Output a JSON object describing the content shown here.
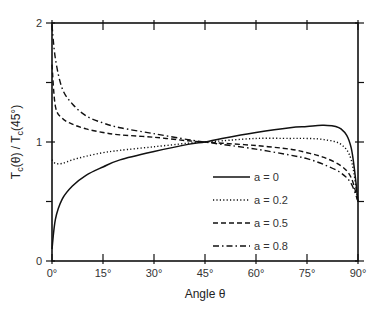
{
  "chart_data": {
    "type": "line",
    "title": "",
    "xlabel": "Angle θ",
    "ylabel": "T_c(θ) / T_c(45°)",
    "xlim": [
      0,
      90
    ],
    "ylim": [
      0,
      2
    ],
    "grid": false,
    "x_ticks": [
      "0°",
      "15°",
      "30°",
      "45°",
      "60°",
      "75°",
      "90°"
    ],
    "x_tick_values": [
      0,
      15,
      30,
      45,
      60,
      75,
      90
    ],
    "y_ticks": [
      "0",
      "1",
      "2"
    ],
    "y_tick_values": [
      0,
      1,
      2
    ],
    "y_minor_ticks": [
      0.5,
      1.5
    ],
    "legend_position": "lower right (inside)",
    "x": [
      0,
      1,
      3,
      6,
      10,
      15,
      20,
      30,
      40,
      45,
      50,
      60,
      70,
      75,
      80,
      85,
      88,
      90
    ],
    "series": [
      {
        "name": "a = 0",
        "style": "solid",
        "values": [
          0.1,
          0.35,
          0.52,
          0.63,
          0.72,
          0.79,
          0.85,
          0.92,
          0.98,
          1.0,
          1.03,
          1.08,
          1.12,
          1.13,
          1.14,
          1.11,
          0.95,
          0.5
        ]
      },
      {
        "name": "a = 0.2",
        "style": "dotted",
        "values": [
          0.85,
          0.82,
          0.82,
          0.85,
          0.88,
          0.91,
          0.93,
          0.96,
          0.99,
          1.0,
          1.01,
          1.03,
          1.03,
          1.03,
          1.02,
          0.98,
          0.85,
          0.5
        ]
      },
      {
        "name": "a = 0.5",
        "style": "dashed",
        "values": [
          1.65,
          1.3,
          1.2,
          1.15,
          1.11,
          1.08,
          1.06,
          1.04,
          1.01,
          1.0,
          0.99,
          0.97,
          0.94,
          0.91,
          0.87,
          0.8,
          0.7,
          0.5
        ]
      },
      {
        "name": "a = 0.8",
        "style": "dash-dot",
        "values": [
          1.98,
          1.7,
          1.45,
          1.32,
          1.22,
          1.16,
          1.12,
          1.07,
          1.02,
          1.0,
          0.98,
          0.94,
          0.89,
          0.86,
          0.81,
          0.74,
          0.65,
          0.5
        ]
      }
    ]
  },
  "legend": {
    "items": [
      {
        "label": "a = 0"
      },
      {
        "label": "a = 0.2"
      },
      {
        "label": "a = 0.5"
      },
      {
        "label": "a = 0.8"
      }
    ]
  },
  "axes": {
    "xlabel": "Angle θ",
    "ylabel_main": "T",
    "ylabel_sub1": "c",
    "ylabel_mid": "(θ) / T",
    "ylabel_sub2": "c",
    "ylabel_end": "(45°)"
  }
}
